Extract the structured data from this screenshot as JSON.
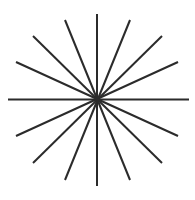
{
  "figure": {
    "name": "starburst-asterisk",
    "width": 195,
    "height": 200,
    "background_color": "#ffffff",
    "line_color": "#2b2b2b",
    "line_width": 2,
    "center": {
      "x": 97,
      "y": 99.5
    },
    "ray_count": 16,
    "line_count": 8,
    "angle_step_degrees": 22.5
  },
  "chart_data": {
    "type": "line",
    "subtitle": "",
    "xlabel": "",
    "ylabel": "",
    "xlim": [
      0,
      195
    ],
    "ylim": [
      0,
      200
    ],
    "grid": false,
    "legend": "none",
    "center": {
      "x": 97,
      "y": 99.5
    },
    "line_color": "#2b2b2b",
    "line_width": 2,
    "series": [
      {
        "name": "line-0-horizontal",
        "angle_degrees": 0,
        "x": [
          8,
          189
        ],
        "y": [
          99.5,
          99.5
        ]
      },
      {
        "name": "line-1-shallow-right-up",
        "angle_degrees": 22.5,
        "x": [
          16,
          178
        ],
        "y": [
          136,
          62
        ]
      },
      {
        "name": "line-2-diagonal-right-up",
        "angle_degrees": 45,
        "x": [
          33,
          162
        ],
        "y": [
          163,
          36
        ]
      },
      {
        "name": "line-3-steep-right-up",
        "angle_degrees": 67.5,
        "x": [
          65,
          130
        ],
        "y": [
          180,
          20
        ]
      },
      {
        "name": "line-4-vertical",
        "angle_degrees": 90,
        "x": [
          97,
          97
        ],
        "y": [
          186,
          14
        ]
      },
      {
        "name": "line-5-steep-left-up",
        "angle_degrees": 112.5,
        "x": [
          130,
          65
        ],
        "y": [
          180,
          20
        ]
      },
      {
        "name": "line-6-diagonal-left-up",
        "angle_degrees": 135,
        "x": [
          162,
          33
        ],
        "y": [
          163,
          36
        ]
      },
      {
        "name": "line-7-shallow-left-up",
        "angle_degrees": 157.5,
        "x": [
          178,
          16
        ],
        "y": [
          136,
          62
        ]
      }
    ],
    "ray_tips": [
      {
        "name": "ray-east",
        "angle_degrees": 0,
        "x": 189,
        "y": 99.5
      },
      {
        "name": "ray-ene",
        "angle_degrees": 22.5,
        "x": 178,
        "y": 62
      },
      {
        "name": "ray-ne",
        "angle_degrees": 45,
        "x": 162,
        "y": 36
      },
      {
        "name": "ray-nne",
        "angle_degrees": 67.5,
        "x": 130,
        "y": 20
      },
      {
        "name": "ray-north",
        "angle_degrees": 90,
        "x": 97,
        "y": 14
      },
      {
        "name": "ray-nnw",
        "angle_degrees": 112.5,
        "x": 65,
        "y": 20
      },
      {
        "name": "ray-nw",
        "angle_degrees": 135,
        "x": 33,
        "y": 36
      },
      {
        "name": "ray-wnw",
        "angle_degrees": 157.5,
        "x": 16,
        "y": 62
      },
      {
        "name": "ray-west",
        "angle_degrees": 180,
        "x": 8,
        "y": 99.5
      },
      {
        "name": "ray-wsw",
        "angle_degrees": 202.5,
        "x": 16,
        "y": 136
      },
      {
        "name": "ray-sw",
        "angle_degrees": 225,
        "x": 33,
        "y": 163
      },
      {
        "name": "ray-ssw",
        "angle_degrees": 247.5,
        "x": 65,
        "y": 180
      },
      {
        "name": "ray-south",
        "angle_degrees": 270,
        "x": 97,
        "y": 186
      },
      {
        "name": "ray-sse",
        "angle_degrees": 292.5,
        "x": 130,
        "y": 180
      },
      {
        "name": "ray-se",
        "angle_degrees": 315,
        "x": 162,
        "y": 163
      },
      {
        "name": "ray-ese",
        "angle_degrees": 337.5,
        "x": 178,
        "y": 136
      }
    ]
  }
}
